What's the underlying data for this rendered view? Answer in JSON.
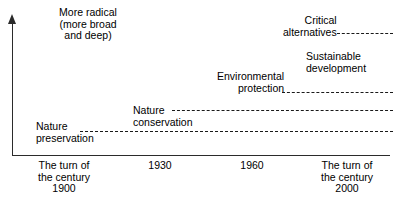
{
  "chart_data": {
    "type": "timeline",
    "title": "",
    "xlabel": "",
    "ylabel": "More radical\n(more broad\nand deep)",
    "grid": false,
    "legend": "none",
    "x_ticks": [
      "The turn of\nthe century\n1900",
      "1930",
      "1960",
      "The turn of\nthe century\n2000"
    ],
    "x_tick_years": [
      1900,
      1930,
      1960,
      2000
    ],
    "series": [
      {
        "name": "Nature\npreservation",
        "start_year": 1910,
        "end_year": 2000,
        "radicalness_level": 1,
        "line_style": "dashed"
      },
      {
        "name": "Nature\nconservation",
        "start_year": 1932,
        "end_year": 2000,
        "radicalness_level": 2,
        "line_style": "dashed"
      },
      {
        "name": "Environmental\nprotection",
        "start_year": 1963,
        "end_year": 2000,
        "radicalness_level": 3,
        "line_style": "dashed"
      },
      {
        "name": "Critical\nalternatives",
        "start_year": 1978,
        "end_year": 2000,
        "radicalness_level": 5,
        "line_style": "dashed"
      },
      {
        "name": "Sustainable\ndevelopment",
        "start_year": 1985,
        "end_year": 2000,
        "radicalness_level": 4,
        "line_style": "none"
      }
    ]
  },
  "axes": {
    "y_caption": "More radical\n(more broad\nand deep)",
    "arrow_direction": "up"
  },
  "trends": {
    "nature_preservation": "Nature\npreservation",
    "nature_conservation": "Nature\nconservation",
    "environmental_protection": "Environmental\nprotection",
    "critical_alternatives": "Critical\nalternatives",
    "sustainable_development": "Sustainable\ndevelopment"
  },
  "x_axis": {
    "tick_1900": "The turn of\nthe century\n1900",
    "tick_1930": "1930",
    "tick_1960": "1960",
    "tick_2000": "The turn of\nthe century\n2000"
  },
  "colors": {
    "ink": "#1a1a1a",
    "axis": "#2b2b2b",
    "background": "#ffffff"
  }
}
